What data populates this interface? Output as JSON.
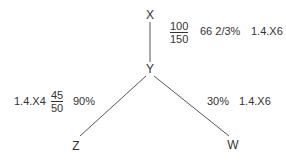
{
  "nodes": {
    "x": "X",
    "y": "Y",
    "z": "Z",
    "w": "W"
  },
  "edges": [
    {
      "from": "X",
      "to": "Y"
    },
    {
      "from": "Y",
      "to": "Z"
    },
    {
      "from": "Y",
      "to": "W"
    }
  ],
  "annotations": {
    "xy": {
      "fraction_numerator": "100",
      "fraction_denominator": "150",
      "percent": "66 2/3%",
      "ref": "1.4.X6"
    },
    "yz": {
      "ref": "1.4.X4",
      "fraction_numerator": "45",
      "fraction_denominator": "50",
      "percent": "90%"
    },
    "yw": {
      "percent": "30%",
      "ref": "1.4.X6"
    }
  },
  "colors": {
    "line": "#555555",
    "text": "#333333"
  }
}
